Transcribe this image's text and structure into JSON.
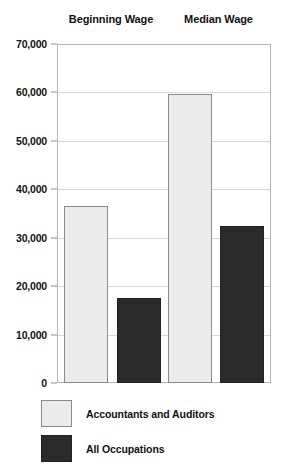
{
  "chart_data": {
    "type": "bar",
    "title": "",
    "subtitle": "",
    "xlabel": "",
    "ylabel": "",
    "categories": [
      "Beginning Wage",
      "Median Wage"
    ],
    "series": [
      {
        "name": "Accountants and Auditors",
        "values": [
          36500,
          59700
        ],
        "color": "#ebebeb"
      },
      {
        "name": "All Occupations",
        "values": [
          17500,
          32500
        ],
        "color": "#2b2b2b"
      }
    ],
    "ylim": [
      0,
      70000
    ],
    "ytick_values": [
      0,
      10000,
      20000,
      30000,
      40000,
      50000,
      60000,
      70000
    ],
    "ytick_labels": [
      "0",
      "10,000",
      "20,000",
      "30,000",
      "40,000",
      "50,000",
      "60,000",
      "70,000"
    ],
    "grid": true,
    "grid_axis": "y",
    "legend_position": "bottom-left",
    "bar_group_layout": "grouped"
  },
  "colors": {
    "light_bar": "#ebebeb",
    "light_bar_border": "#8a8a8a",
    "dark_bar": "#2b2b2b",
    "dark_bar_border": "#222222",
    "gridline": "#d8d8d8",
    "frame": "#b5b5b5",
    "text": "#111111",
    "background": "#ffffff"
  },
  "headers": {
    "group_0": "Beginning Wage",
    "group_1": "Median Wage"
  },
  "yticks": {
    "t0": "70,000",
    "t1": "60,000",
    "t2": "50,000",
    "t3": "40,000",
    "t4": "30,000",
    "t5": "20,000",
    "t6": "10,000",
    "t7": "0"
  },
  "legend": {
    "item_0": "Accountants and Auditors",
    "item_1": "All Occupations"
  }
}
